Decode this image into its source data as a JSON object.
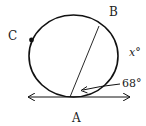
{
  "diagram": {
    "type": "circle-tangent-chord",
    "points": {
      "A": {
        "label": "A"
      },
      "B": {
        "label": "B"
      },
      "C": {
        "label": "C"
      }
    },
    "angles": {
      "given": "68°",
      "unknown": "x°"
    },
    "colors": {
      "stroke": "#111111",
      "text": "#222222",
      "background": "#ffffff"
    }
  }
}
